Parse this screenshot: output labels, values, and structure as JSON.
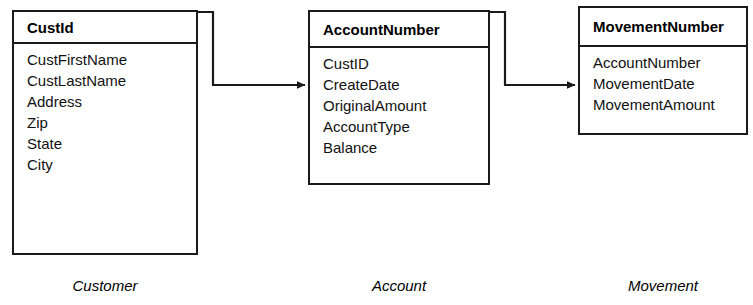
{
  "diagram": {
    "type": "entity-relationship-diagram",
    "background_color": "#ffffff",
    "line_color": "#1a1a1a",
    "text_color": "#000000"
  },
  "entities": [
    {
      "caption": "Customer",
      "primary_key": "CustId",
      "fields": [
        "CustFirstName",
        "CustLastName",
        "Address",
        "Zip",
        "State",
        "City"
      ]
    },
    {
      "caption": "Account",
      "primary_key": "AccountNumber",
      "fields": [
        "CustID",
        "CreateDate",
        "OriginalAmount",
        "AccountType",
        "Balance"
      ]
    },
    {
      "caption": "Movement",
      "primary_key": "MovementNumber",
      "fields": [
        "AccountNumber",
        "MovementDate",
        "MovementAmount"
      ]
    }
  ],
  "relationships": [
    {
      "from": "Customer",
      "to": "Account",
      "style": "elbow-arrow"
    },
    {
      "from": "Account",
      "to": "Movement",
      "style": "elbow-arrow"
    }
  ]
}
